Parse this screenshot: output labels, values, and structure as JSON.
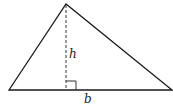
{
  "diagram": {
    "type": "triangle-with-height",
    "labels": {
      "height": "h",
      "base": "b"
    },
    "colors": {
      "stroke": "#1a1a1a",
      "background": "#ffffff"
    }
  }
}
